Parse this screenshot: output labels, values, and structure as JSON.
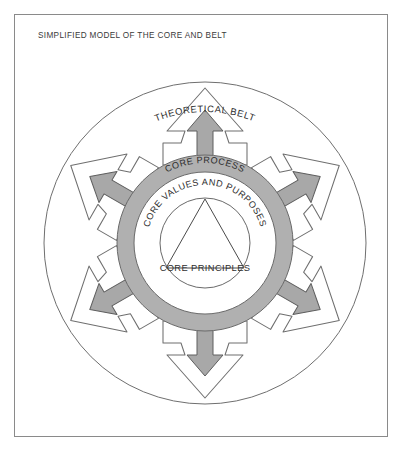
{
  "figure": {
    "title": "SIMPLIFIED MODEL OF THE CORE AND BELT",
    "background_color": "#ffffff",
    "frame_color": "#8a8a8a"
  },
  "diagram": {
    "type": "concentric-radial-model",
    "center": {
      "x": 205,
      "y": 243
    },
    "labels": {
      "outer_ring": "THEORETICAL BELT",
      "gray_ring": "CORE PROCESS",
      "inner_ring": "CORE VALUES AND PURPOSES",
      "core": "CORE PRINCIPLES"
    },
    "rings": [
      {
        "name": "theoretical-belt",
        "radius": 161,
        "fill": "none",
        "stroke": "#6f6f6f"
      },
      {
        "name": "core-process-outer",
        "radius": 88,
        "fill": "#b0b0b0",
        "stroke": "#6a6a6a"
      },
      {
        "name": "core-process-inner",
        "radius": 71,
        "fill": "#ffffff",
        "stroke": "#6a6a6a"
      },
      {
        "name": "core-values-circle",
        "radius": 45,
        "fill": "#ffffff",
        "stroke": "#6a6a6a"
      }
    ],
    "core_shape": {
      "name": "triangle",
      "fill": "none",
      "stroke": "#4a4a4a"
    },
    "arrows": {
      "count": 6,
      "angles_deg": [
        270,
        330,
        30,
        90,
        150,
        210
      ],
      "gray_fill": "#a8a8a8",
      "gray_stroke": "#5e5e5e",
      "outline_fill": "#ffffff",
      "outline_stroke": "#6f6f6f",
      "direction": "outward"
    }
  }
}
